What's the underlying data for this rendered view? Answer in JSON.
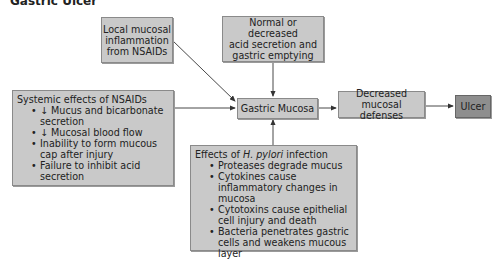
{
  "title": "Gastric Ulcer",
  "nodes": {
    "local_inflammation": {
      "lines": [
        "Local mucosal",
        "inflammation",
        "from NSAIDs"
      ]
    },
    "acid_secretion": {
      "lines": [
        "Normal or decreased",
        "acid secretion and",
        "gastric emptying"
      ]
    },
    "gastric_mucosa": {
      "label": "Gastric Mucosa"
    },
    "decreased_defenses": {
      "lines": [
        "Decreased mucosal",
        "defenses"
      ]
    },
    "ulcer": {
      "label": "Ulcer"
    },
    "systemic_nsaids": {
      "heading": "Systemic effects of NSAIDs",
      "items": [
        "↓ Mucus and bicarbonate secretion",
        "↓ Mucosal blood flow",
        "Inability to form mucous cap after injury",
        "Failure to inhibit acid secretion"
      ]
    },
    "h_pylori": {
      "heading_prefix": "Effects of ",
      "heading_italic": "H. pylori",
      "heading_suffix": " infection",
      "items": [
        "Proteases degrade mucus",
        "Cytokines cause inflammatory changes in mucosa",
        "Cytotoxins cause epithelial cell injury and death",
        "Bacteria penetrates gastric cells and weakens mucous layer"
      ]
    }
  },
  "colors": {
    "box_fill": "#c9c9c9",
    "ulcer_fill": "#8e8e8e",
    "border": "#8a8a8a",
    "arrow": "#333333"
  }
}
